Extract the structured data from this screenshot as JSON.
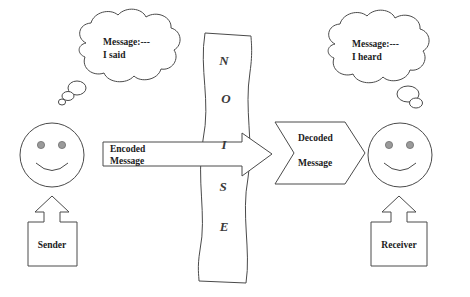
{
  "diagram": {
    "colors": {
      "stroke": "#4a4a4a",
      "text": "#1b1b1b",
      "eye_fill": "#9a9a9a",
      "background": "#ffffff",
      "noise_letter": "#3a3a3a"
    },
    "sender": {
      "label": "Sender",
      "thought": {
        "line1": "Message:---",
        "line2": "I said"
      },
      "face": "smiley-face"
    },
    "receiver": {
      "label": "Receiver",
      "thought": {
        "line1": "Message:---",
        "line2": "I heard"
      },
      "face": "smiley-face"
    },
    "encoded_message": {
      "line1": "Encoded",
      "line2": "Message"
    },
    "decoded_message": {
      "line1": "Decoded",
      "line2": "Message"
    },
    "noise": {
      "word": "NOISE",
      "letters": [
        "N",
        "O",
        "I",
        "S",
        "E"
      ]
    }
  }
}
